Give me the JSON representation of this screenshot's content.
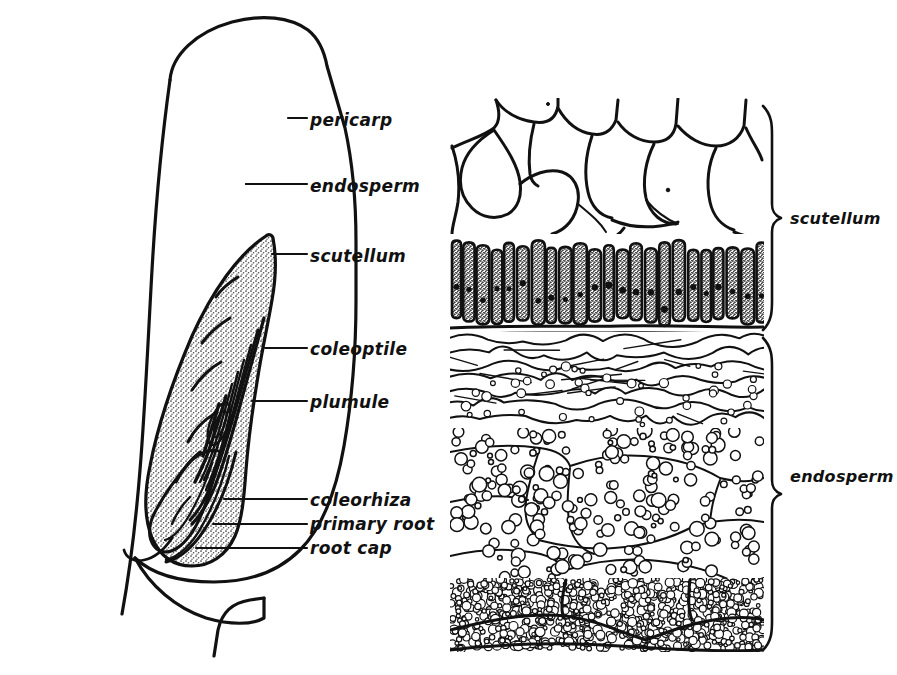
{
  "figure": {
    "background_color": "#ffffff",
    "ink_color": "#111111"
  },
  "left_panel": {
    "name": "whole-grain-section",
    "labels": [
      {
        "id": "pericarp",
        "text": "pericarp",
        "text_x": 310,
        "text_y": 126,
        "leader": [
          [
            288,
            118
          ],
          [
            307,
            118
          ]
        ],
        "anchor": [
          288,
          118
        ]
      },
      {
        "id": "endosperm",
        "text": "endosperm",
        "text_x": 310,
        "text_y": 192,
        "leader": [
          [
            246,
            184
          ],
          [
            307,
            184
          ]
        ],
        "anchor": [
          246,
          184
        ]
      },
      {
        "id": "scutellum",
        "text": "scutellum",
        "text_x": 310,
        "text_y": 262,
        "leader": [
          [
            272,
            254
          ],
          [
            307,
            254
          ]
        ],
        "anchor": [
          272,
          254
        ]
      },
      {
        "id": "coleoptile",
        "text": "coleoptile",
        "text_x": 310,
        "text_y": 355,
        "leader": [
          [
            265,
            348
          ],
          [
            307,
            348
          ]
        ],
        "anchor": [
          265,
          348
        ]
      },
      {
        "id": "plumule",
        "text": "plumule",
        "text_x": 310,
        "text_y": 408,
        "leader": [
          [
            252,
            401
          ],
          [
            307,
            401
          ]
        ],
        "anchor": [
          252,
          401
        ]
      },
      {
        "id": "coleorhiza",
        "text": "coleorhiza",
        "text_x": 310,
        "text_y": 506,
        "leader": [
          [
            224,
            499
          ],
          [
            307,
            499
          ]
        ],
        "anchor": [
          224,
          499
        ]
      },
      {
        "id": "primary-root",
        "text": "primary root",
        "text_x": 310,
        "text_y": 530,
        "leader": [
          [
            213,
            524
          ],
          [
            307,
            524
          ]
        ],
        "anchor": [
          213,
          524
        ]
      },
      {
        "id": "root-cap",
        "text": "root cap",
        "text_x": 310,
        "text_y": 554,
        "leader": [
          [
            196,
            548
          ],
          [
            307,
            548
          ]
        ],
        "anchor": [
          196,
          548
        ]
      }
    ]
  },
  "right_panel": {
    "name": "tissue-detail-section",
    "brackets": [
      {
        "id": "scutellum",
        "text": "scutellum",
        "top": 106,
        "bottom": 330,
        "x": 772,
        "text_x": 790,
        "text_y": 224
      },
      {
        "id": "endosperm",
        "text": "endosperm",
        "top": 338,
        "bottom": 650,
        "x": 772,
        "text_x": 790,
        "text_y": 482
      }
    ],
    "region_bounds": {
      "left": 452,
      "right": 762,
      "top": 100,
      "bottom": 652
    },
    "tissue_zones": [
      {
        "id": "parenchyma",
        "label": "large thin-walled scutellum parenchyma cells",
        "top": 100,
        "bottom": 232
      },
      {
        "id": "palisade-epithelium",
        "label": "columnar scutellar epithelium with nuclei",
        "top": 232,
        "bottom": 330
      },
      {
        "id": "crushed-cells",
        "label": "flattened crushed endosperm cells",
        "top": 334,
        "bottom": 428
      },
      {
        "id": "aleurone-starch",
        "label": "starchy endosperm cells with starch grains",
        "top": 428,
        "bottom": 578
      },
      {
        "id": "fine-starch",
        "label": "dense small starch grain endosperm",
        "top": 578,
        "bottom": 650
      }
    ]
  }
}
